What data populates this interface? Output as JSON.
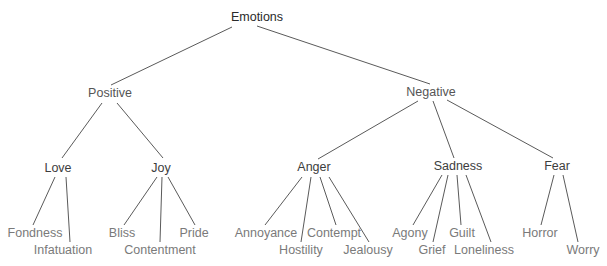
{
  "diagram": {
    "type": "tree",
    "title": "Emotions",
    "root": {
      "label": "Emotions",
      "children": [
        {
          "label": "Positive",
          "children": [
            {
              "label": "Love",
              "children": [
                {
                  "label": "Fondness"
                },
                {
                  "label": "Infatuation"
                }
              ]
            },
            {
              "label": "Joy",
              "children": [
                {
                  "label": "Bliss"
                },
                {
                  "label": "Contentment"
                },
                {
                  "label": "Pride"
                }
              ]
            }
          ]
        },
        {
          "label": "Negative",
          "children": [
            {
              "label": "Anger",
              "children": [
                {
                  "label": "Annoyance"
                },
                {
                  "label": "Hostility"
                },
                {
                  "label": "Contempt"
                },
                {
                  "label": "Jealousy"
                }
              ]
            },
            {
              "label": "Sadness",
              "children": [
                {
                  "label": "Agony"
                },
                {
                  "label": "Grief"
                },
                {
                  "label": "Guilt"
                },
                {
                  "label": "Loneliness"
                }
              ]
            },
            {
              "label": "Fear",
              "children": [
                {
                  "label": "Horror"
                },
                {
                  "label": "Worry"
                }
              ]
            }
          ]
        }
      ]
    }
  },
  "nodes": {
    "emotions": "Emotions",
    "positive": "Positive",
    "negative": "Negative",
    "love": "Love",
    "joy": "Joy",
    "anger": "Anger",
    "sadness": "Sadness",
    "fear": "Fear",
    "fondness": "Fondness",
    "infatuation": "Infatuation",
    "bliss": "Bliss",
    "contentment": "Contentment",
    "pride": "Pride",
    "annoyance": "Annoyance",
    "hostility": "Hostility",
    "contempt": "Contempt",
    "jealousy": "Jealousy",
    "agony": "Agony",
    "grief": "Grief",
    "guilt": "Guilt",
    "loneliness": "Loneliness",
    "horror": "Horror",
    "worry": "Worry"
  },
  "colors": {
    "edge": "#5a5a5a",
    "root_text": "#2a2a2a",
    "category_text": "#555555",
    "subcategory_text": "#3d3d3d",
    "leaf_text": "#7a7a7a",
    "background": "#ffffff"
  }
}
